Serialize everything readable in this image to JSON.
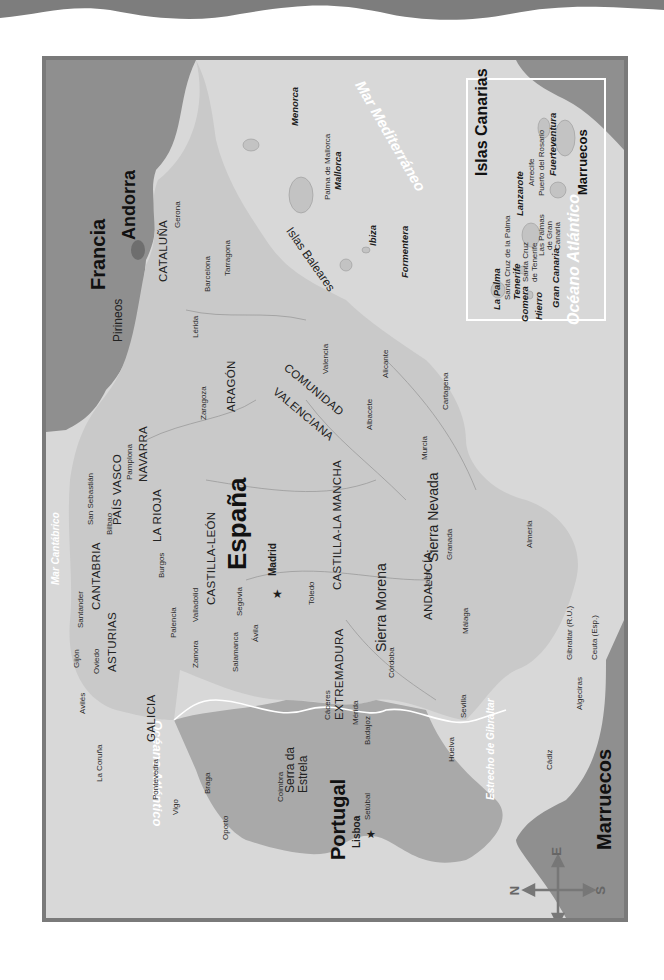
{
  "map": {
    "orientation": "rotated 90deg, north to the left",
    "countries": {
      "spain": "España",
      "portugal": "Portugal",
      "france": "Francia",
      "andorra": "Andorra",
      "morocco": "Marruecos",
      "morocco_inset": "Marruecos"
    },
    "seas": {
      "atlantic": "Océano Atlántico",
      "atlantic_inset": "Océano Atlántico",
      "mediterranean": "Mar Mediterráneo",
      "cantabrico": "Mar Cantábrico",
      "gibraltar_strait": "Estrecho de Gibraltar"
    },
    "regions": {
      "galicia": "GALICIA",
      "asturias": "ASTURIAS",
      "cantabria": "CANTABRIA",
      "pais_vasco": "PAÍS VASCO",
      "navarra": "NAVARRA",
      "la_rioja": "LA RIOJA",
      "aragon": "ARAGÓN",
      "cataluna": "CATALUÑA",
      "castilla_leon": "CASTILLA-LEÓN",
      "castilla_la_mancha": "CASTILLA-LA MANCHA",
      "extremadura": "EXTREMADURA",
      "andalucia": "ANDALUCÍA",
      "comunidad_valenciana_1": "COMUNIDAD",
      "comunidad_valenciana_2": "VALENCIANA"
    },
    "mountains": {
      "pirineos": "Pirineos",
      "sierra_morena": "Sierra Morena",
      "sierra_nevada": "Sierra Nevada",
      "serra_estrela_1": "Serra da",
      "serra_estrela_2": "Estrela"
    },
    "capitals": {
      "madrid": "Madrid",
      "lisboa": "Lisboa"
    },
    "cities": {
      "gerona": "Gerona",
      "barcelona": "Barcelona",
      "tarragona": "Tarragona",
      "lerida": "Lérida",
      "zaragoza": "Zaragoza",
      "valencia": "Valencia",
      "alicante": "Alicante",
      "albacete": "Albacete",
      "murcia": "Murcia",
      "cartagena": "Cartagena",
      "almeria": "Almería",
      "granada": "Granada",
      "jaen": "Jaén",
      "malaga": "Málaga",
      "cordoba": "Córdoba",
      "sevilla": "Sevilla",
      "huelva": "Huelva",
      "cadiz": "Cádiz",
      "algeciras": "Algeciras",
      "gibraltar": "Gibraltar (R.U.)",
      "ceuta": "Ceuta (Esp.)",
      "melilla": "Melilla (Esp.)",
      "toledo": "Toledo",
      "merida": "Mérida",
      "badajoz": "Badajoz",
      "caceres": "Cáceres",
      "salamanca": "Salamanca",
      "avila": "Ávila",
      "segovia": "Segovia",
      "valladolid": "Valladolid",
      "zamora": "Zamora",
      "palencia": "Palencia",
      "burgos": "Burgos",
      "bilbao": "Bilbao",
      "san_sebastian": "San Sebastián",
      "pamplona": "Pamplona",
      "santander": "Santander",
      "oviedo": "Oviedo",
      "gijon": "Gijón",
      "aviles": "Avilés",
      "la_coruna": "La Coruña",
      "pontevedra": "Pontevedra",
      "vigo": "Vigo",
      "braga": "Braga",
      "oporto": "Oporto",
      "coimbra": "Coimbra",
      "setubal": "Setúbal",
      "palma": "Palma de Mallorca"
    },
    "balearics": {
      "group": "Islas Baleares",
      "menorca": "Menorca",
      "mallorca": "Mallorca",
      "ibiza": "Ibiza",
      "formentera": "Formentera"
    },
    "canarias_inset": {
      "title": "Islas Canarias",
      "islands": {
        "la_palma": "La Palma",
        "tenerife": "Tenerife",
        "gomera": "Gomera",
        "hierro": "Hierro",
        "gran_canaria": "Gran Canaria",
        "lanzarote": "Lanzarote",
        "fuerteventura": "Fuerteventura"
      },
      "cities": {
        "santa_cruz_palma": "Santa Cruz de la Palma",
        "santa_cruz_tenerife_1": "Santa Cruz",
        "santa_cruz_tenerife_2": "de Tenerife",
        "las_palmas_1": "Las Palmas",
        "las_palmas_2": "de Gran",
        "las_palmas_3": "Canaria",
        "arrecife": "Arrecife",
        "puerto_rosario": "Puerto del Rosario"
      }
    },
    "compass": {
      "n": "N",
      "s": "S",
      "e": "E",
      "o": "O"
    },
    "colors": {
      "sea": "#d8d8d8",
      "spain_land": "#c9c9c9",
      "portugal_land": "#a9a9a9",
      "france_land": "#8f8f8f",
      "andorra": "#6e6e6e",
      "frame": "#7a7a7a",
      "top_banner": "#7d7d7d"
    }
  }
}
